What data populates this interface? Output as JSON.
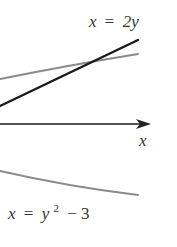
{
  "diagram": {
    "type": "graph-of-curves",
    "colors": {
      "line_dark": "#1a1a1a",
      "curve_grey": "#8a8a8a",
      "axis": "#333333",
      "text": "#333333",
      "background": "#ffffff"
    },
    "axis": {
      "x_label": "x",
      "arrow": "right"
    },
    "curves": [
      {
        "name": "line",
        "equation_lhs": "x",
        "equation_eq": "=",
        "equation_rhs": "2y",
        "label": "x = 2y",
        "style": "dark"
      },
      {
        "name": "parabola",
        "equation_lhs": "x",
        "equation_eq": "=",
        "equation_rhs_base": "y",
        "equation_rhs_exp": "2",
        "equation_rhs_tail": "− 3",
        "label": "x = y² − 3",
        "style": "grey"
      }
    ]
  }
}
